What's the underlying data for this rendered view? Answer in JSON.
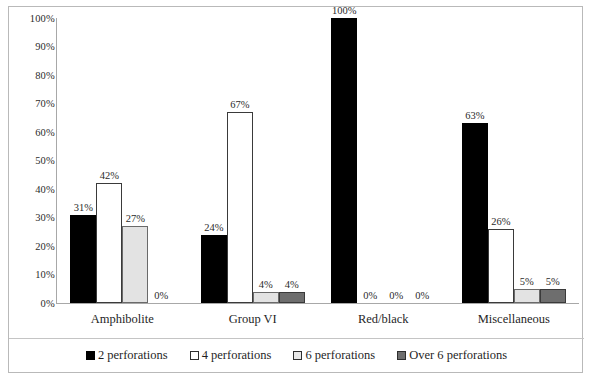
{
  "chart_data": {
    "type": "bar",
    "title": "",
    "subtitle": "",
    "xlabel": "",
    "ylabel": "",
    "ylim": [
      0,
      100
    ],
    "grid": false,
    "legend_position": "bottom",
    "categories": [
      "Amphibolite",
      "Group VI",
      "Red/black",
      "Miscellaneous"
    ],
    "y_ticks": [
      "0%",
      "10%",
      "20%",
      "30%",
      "40%",
      "50%",
      "60%",
      "70%",
      "80%",
      "90%",
      "100%"
    ],
    "y_tick_values": [
      0,
      10,
      20,
      30,
      40,
      50,
      60,
      70,
      80,
      90,
      100
    ],
    "series": [
      {
        "name": "2 perforations",
        "color": "#000000",
        "values": [
          31,
          24,
          100,
          63
        ],
        "labels": [
          "31%",
          "24%",
          "100%",
          "63%"
        ]
      },
      {
        "name": "4 perforations",
        "color": "#ffffff",
        "values": [
          42,
          67,
          0,
          26
        ],
        "labels": [
          "42%",
          "67%",
          "0%",
          "26%"
        ]
      },
      {
        "name": "6 perforations",
        "color": "#e3e3e3",
        "values": [
          27,
          4,
          0,
          5
        ],
        "labels": [
          "27%",
          "4%",
          "0%",
          "5%"
        ]
      },
      {
        "name": "Over 6 perforations",
        "color": "#6e6e6e",
        "values": [
          0,
          4,
          0,
          5
        ],
        "labels": [
          "0%",
          "4%",
          "0%",
          "5%"
        ]
      }
    ]
  }
}
